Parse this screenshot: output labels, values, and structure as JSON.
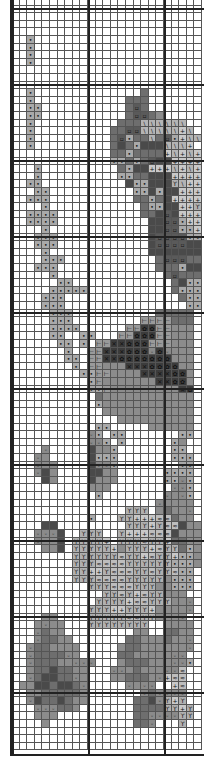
{
  "chart": {
    "title": "",
    "cell_size": 7.6,
    "columns": 25,
    "rows": 99,
    "major_every": 10,
    "legend": {
      ".": {
        "color": "#ffffff",
        "symbol": ""
      },
      "a": {
        "color": "#a9a9a9",
        "symbol": "•"
      },
      "b": {
        "color": "#8c8c8c",
        "symbol": ""
      },
      "c": {
        "color": "#6e6e6e",
        "symbol": ""
      },
      "d": {
        "color": "#4a4a4a",
        "symbol": ""
      },
      "e": {
        "color": "#5a5a5a",
        "symbol": "▫"
      },
      "f": {
        "color": "#b4b4b4",
        "symbol": "\\"
      },
      "g": {
        "color": "#c8c8c8",
        "symbol": "+"
      },
      "h": {
        "color": "#b0b0b0",
        "symbol": "ϒ"
      },
      "i": {
        "color": "#3c3c3c",
        "symbol": "✕"
      },
      "j": {
        "color": "#3c3c3c",
        "symbol": "✿"
      },
      "k": {
        "color": "#9a9a9a",
        "symbol": "⊢"
      },
      "l": {
        "color": "#8a8a8a",
        "symbol": "◦"
      },
      "m": {
        "color": "#bdbdbd",
        "symbol": "≈"
      }
    },
    "grid": [
      ".........................",
      ".........................",
      ".........................",
      ".........................",
      ".........................",
      "..a......................",
      "..a......................",
      "..a......................",
      "..a......................",
      ".........................",
      ".........................",
      ".........................",
      "..a..............c.......",
      "..a............ccc.......",
      "..aa...........cec.......",
      "..aa...........ceecb.....",
      "..a...........cccffffff..",
      "..a..........cceefffffgf.",
      "..a..........ceaccfceagff",
      "..a..........cdcadddfffg.",
      ".............ccaccccgfgfg",
      ".............aacaceddgggg",
      "...a..........caddgggfgfg",
      "...a..........aaccdddgggg",
      "..aa...........daadddhfgg",
      "...aa...........aadaddggg",
      "..aaa...........ccacdgggg",
      "....a............caaddggh",
      "..aaaa...........ccdedggg",
      "..aaaa............ddeeagg",
      "....a.............ddeeaag",
      "...aaa............deeeeaa",
      "...aaa............deeeedd",
      "....a.............ddddddd",
      "....aaa............ceeecc",
      "...aaa.............cccadd",
      ".....a..............ceccc",
      "......aa.............cdaa",
      ".....aaaaa...........caaa",
      "....aaa...............caa",
      "....aaa................aa",
      ".....aaa...........ccccc",
      ".....aaa.........kkkkccc",
      ".....aaaa......kkjjkkbbb",
      ".....aa..aa...kkjjjkkbbb",
      "......aa.a.kkiijjjkkkbbb",
      ".......a..kkiiijjjljlbbb",
      ".......aa.kkiijjjjjjjbbb",
      "........a.kkbbbiiijjjjbb",
      ".........aakkbbbbiiiijjb",
      "..........akbbbbbbbiijjb",
      "..........aakbbbbbbbbbij",
      "...........cbbbbbbbbbbbb",
      "...........abbbbbbbbbbbb",
      "............bbbbbbbbbbbb",
      "..............bbbbbbbbbb",
      "...........aa.....bbbbbb",
      "..........la.aa.......aa",
      "..........lla.a......ab.",
      "....l.....dbba.......aa.",
      "...lb.....daaa.......aaa",
      "...lbb....dlla........aa",
      "...ldb....ddbb......aaaa",
      "....db....dbbb......aala",
      "..........bbb........lla",
      "...........a........lbla",
      "...................lbbbb",
      "...............hhh.bcbbl",
      "..........a...hhgggmmcbb",
      "....dd.........hhhghmmdbb",
      "...llld..hhh..hgggmmmdbbb",
      "...lbbd.hhhhg.hhhmhhgccbb",
      "....bbd.hhhhhgbhhhgmhhcab",
      "........hhhhhhmhhgmhhgaab",
      "........hhhmmmmhhhhhhaaab",
      "........hhgghmmmhhmhhmaa",
      "........hhhmmmmhhhhhbaaa",
      "..........hhhmmmhhhbbaaa",
      "............hhmhgmhhbbb",
      "...........hhhhgmmhhhbbl",
      "..........hhhgghhhgbbbbl",
      "....bb....hhhhhmmhhbbbl.",
      "...blbb...hhhhhhhh..bbbb",
      "...lcbb.........bb..ccbb",
      "...lccbb.......ccbbbcbbl",
      "..lccbbbb.....bccbbbbbbl",
      "..lcccclb.....ccbbbbbll",
      "..lcccbblll...bcccbbblla",
      "..bccdccbb...llbcbbbllm",
      "..lcddcclb...bbcccblgmm",
      ".bbddcddcl.....lbll..gm",
      "..bbcccccb.......lcllll",
      "..ldccdcbb......ccdlhgh",
      "...lllccb.......cccchhgh",
      "...bbb..........ccllllhh",
      "....b...........ccl...h.",
      ".........................",
      ".........................",
      "........................."
    ]
  }
}
